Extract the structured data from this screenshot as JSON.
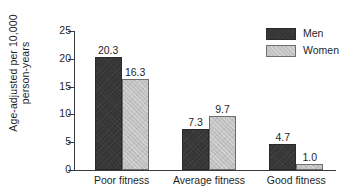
{
  "chart_data": {
    "type": "bar",
    "title": "",
    "subtitle": "",
    "xlabel": "",
    "ylabel_line1": "Age-adjusted per 10,000",
    "ylabel_line2": "person-years",
    "categories": [
      "Poor fitness",
      "Average fitness",
      "Good fitness"
    ],
    "series": [
      {
        "name": "Men",
        "color": "#343434",
        "values": [
          20.3,
          7.3,
          4.7
        ],
        "labels": [
          "20.3",
          "7.3",
          "4.7"
        ]
      },
      {
        "name": "Women",
        "color": "#c2c2c2",
        "values": [
          16.3,
          9.7,
          1.0
        ],
        "labels": [
          "16.3",
          "9.7",
          "1.0"
        ]
      }
    ],
    "ylim": [
      0,
      25
    ],
    "yticks": [
      0,
      5,
      10,
      15,
      20,
      25
    ],
    "ytick_labels": [
      "0",
      "5",
      "10",
      "15",
      "20",
      "25"
    ],
    "grid": false,
    "legend_position": "top-right"
  },
  "legend": {
    "items": [
      {
        "label": "Men"
      },
      {
        "label": "Women"
      }
    ]
  },
  "colors": {
    "men_bar": "#343434",
    "women_bar": "#c2c2c2",
    "axis": "#3a3a3a",
    "text": "#1f1f1f",
    "background": "#ffffff"
  }
}
